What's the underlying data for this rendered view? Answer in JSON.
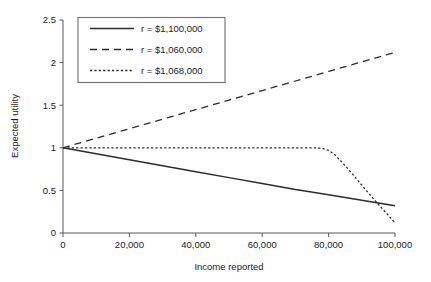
{
  "chart_data": {
    "type": "line",
    "title": "",
    "xlabel": "Income reported",
    "ylabel": "Expected utility",
    "xlim": [
      0,
      100000
    ],
    "ylim": [
      0,
      2.5
    ],
    "xticks": [
      0,
      20000,
      40000,
      60000,
      80000,
      100000
    ],
    "xticklabels": [
      "0",
      "20,000",
      "40,000",
      "60,000",
      "80,000",
      "100,000"
    ],
    "yticks": [
      0,
      0.5,
      1,
      1.5,
      2,
      2.5
    ],
    "yticklabels": [
      "0",
      "0.5",
      "1",
      "1.5",
      "2",
      "2.5"
    ],
    "grid": false,
    "legend_position": "upper-left-inside",
    "line_color": "#2b2b33",
    "series": [
      {
        "name": "r = $1,100,000",
        "style": "solid",
        "x": [
          0,
          10000,
          20000,
          30000,
          40000,
          50000,
          60000,
          70000,
          80000,
          90000,
          100000
        ],
        "values": [
          1.0,
          0.93,
          0.86,
          0.79,
          0.72,
          0.65,
          0.58,
          0.51,
          0.45,
          0.385,
          0.32
        ]
      },
      {
        "name": "r = $1,060,000",
        "style": "dashed",
        "x": [
          0,
          10000,
          20000,
          30000,
          40000,
          50000,
          60000,
          70000,
          80000,
          90000,
          100000
        ],
        "values": [
          1.0,
          1.112,
          1.224,
          1.336,
          1.448,
          1.56,
          1.672,
          1.784,
          1.896,
          2.008,
          2.12
        ]
      },
      {
        "name": "r = $1,068,000",
        "style": "dotted",
        "x": [
          0,
          10000,
          20000,
          30000,
          40000,
          50000,
          60000,
          70000,
          76000,
          78000,
          80000,
          82000,
          85000,
          88000,
          91000,
          94000,
          97000,
          100000
        ],
        "values": [
          1.0,
          1.0,
          1.0,
          1.0,
          1.0,
          1.0,
          1.0,
          1.0,
          1.0,
          0.995,
          0.97,
          0.915,
          0.79,
          0.655,
          0.515,
          0.38,
          0.25,
          0.12
        ]
      }
    ]
  },
  "legend": {
    "items": [
      {
        "label": "r = $1,100,000",
        "style": "solid"
      },
      {
        "label": "r = $1,060,000",
        "style": "dashed"
      },
      {
        "label": "r = $1,068,000",
        "style": "dotted"
      }
    ]
  }
}
